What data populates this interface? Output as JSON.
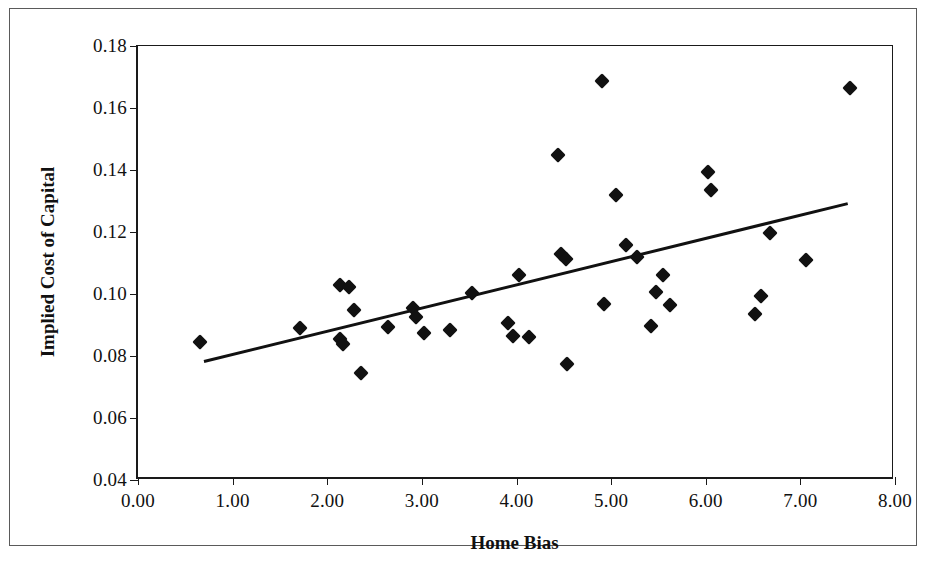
{
  "chart_data": {
    "type": "scatter",
    "title": "",
    "xlabel": "Home Bias",
    "ylabel": "Implied Cost of Capital",
    "xlim": [
      0.0,
      8.0
    ],
    "ylim": [
      0.04,
      0.18
    ],
    "grid": false,
    "legend": null,
    "marker": "diamond",
    "marker_color": "#111111",
    "line_color": "#111111",
    "xticks": [
      0.0,
      1.0,
      2.0,
      3.0,
      4.0,
      5.0,
      6.0,
      7.0,
      8.0
    ],
    "xticklabels": [
      "0.00",
      "1.00",
      "2.00",
      "3.00",
      "4.00",
      "5.00",
      "6.00",
      "7.00",
      "8.00"
    ],
    "yticks": [
      0.04,
      0.06,
      0.08,
      0.1,
      0.12,
      0.14,
      0.16,
      0.18
    ],
    "yticklabels": [
      "0.04",
      "0.06",
      "0.08",
      "0.10",
      "0.12",
      "0.14",
      "0.16",
      "0.18"
    ],
    "points": [
      {
        "x": 0.66,
        "y": 0.0845
      },
      {
        "x": 1.71,
        "y": 0.089
      },
      {
        "x": 2.13,
        "y": 0.103
      },
      {
        "x": 2.14,
        "y": 0.0855
      },
      {
        "x": 2.17,
        "y": 0.084
      },
      {
        "x": 2.23,
        "y": 0.1022
      },
      {
        "x": 2.28,
        "y": 0.095
      },
      {
        "x": 2.36,
        "y": 0.0745
      },
      {
        "x": 2.64,
        "y": 0.0893
      },
      {
        "x": 2.91,
        "y": 0.0955
      },
      {
        "x": 2.94,
        "y": 0.0925
      },
      {
        "x": 3.02,
        "y": 0.0875
      },
      {
        "x": 3.3,
        "y": 0.0885
      },
      {
        "x": 3.53,
        "y": 0.1003
      },
      {
        "x": 3.91,
        "y": 0.0905
      },
      {
        "x": 3.96,
        "y": 0.0865
      },
      {
        "x": 4.03,
        "y": 0.1062
      },
      {
        "x": 4.13,
        "y": 0.086
      },
      {
        "x": 4.44,
        "y": 0.145
      },
      {
        "x": 4.47,
        "y": 0.1128
      },
      {
        "x": 4.52,
        "y": 0.1113
      },
      {
        "x": 4.53,
        "y": 0.0775
      },
      {
        "x": 4.9,
        "y": 0.1688
      },
      {
        "x": 4.92,
        "y": 0.0968
      },
      {
        "x": 5.05,
        "y": 0.1318
      },
      {
        "x": 5.16,
        "y": 0.1158
      },
      {
        "x": 5.27,
        "y": 0.1118
      },
      {
        "x": 5.42,
        "y": 0.0898
      },
      {
        "x": 5.47,
        "y": 0.1008
      },
      {
        "x": 5.55,
        "y": 0.1062
      },
      {
        "x": 5.62,
        "y": 0.0963
      },
      {
        "x": 6.02,
        "y": 0.1392
      },
      {
        "x": 6.06,
        "y": 0.1337
      },
      {
        "x": 6.52,
        "y": 0.0935
      },
      {
        "x": 6.58,
        "y": 0.0992
      },
      {
        "x": 6.68,
        "y": 0.1197
      },
      {
        "x": 7.06,
        "y": 0.111
      },
      {
        "x": 7.52,
        "y": 0.1663
      }
    ],
    "trendline": {
      "type": "linear",
      "x_start": 0.7,
      "y_start": 0.0775,
      "x_end": 7.53,
      "y_end": 0.1288
    }
  }
}
